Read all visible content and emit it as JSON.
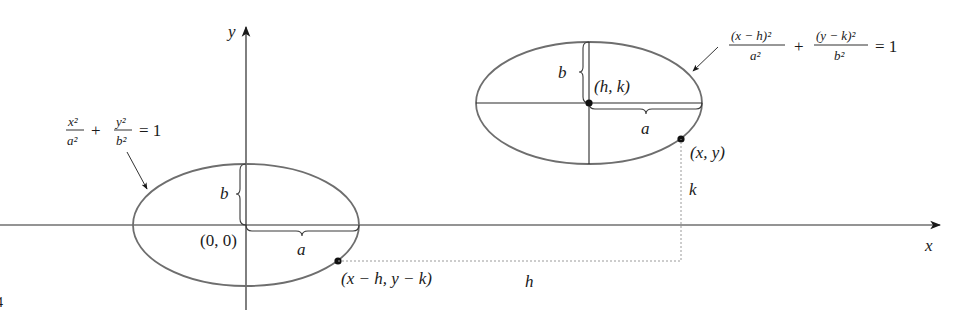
{
  "axes": {
    "x_label": "x",
    "y_label": "y"
  },
  "left_ellipse": {
    "equation": {
      "term1_num": "x²",
      "term1_den": "a²",
      "plus": "+",
      "term2_num": "y²",
      "term2_den": "b²",
      "rhs": "= 1"
    },
    "center_label": "(0, 0)",
    "semi_major_label": "a",
    "semi_minor_label": "b",
    "point_label": "(x − h, y − k)"
  },
  "right_ellipse": {
    "equation": {
      "term1_num": "(x − h)²",
      "term1_den": "a²",
      "plus": "+",
      "term2_num": "(y − k)²",
      "term2_den": "b²",
      "rhs": "= 1"
    },
    "center_label": "(h, k)",
    "semi_major_label": "a",
    "semi_minor_label": "b",
    "point_label": "(x, y)"
  },
  "shift": {
    "horizontal_label": "h",
    "vertical_label": "k"
  },
  "figure_number_fragment": "4",
  "colors": {
    "curve": "#6e6e6e",
    "axis": "#2a2a2a",
    "dashed": "#9a9a9a",
    "text": "#1a1a1a"
  }
}
